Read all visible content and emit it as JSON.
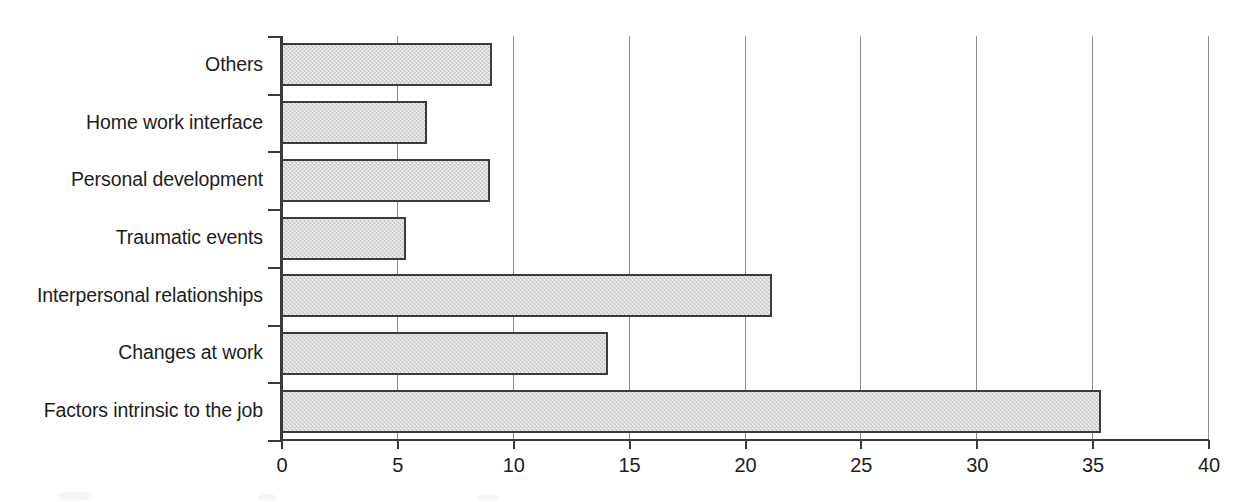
{
  "chart_data": {
    "type": "bar",
    "orientation": "horizontal",
    "title": "",
    "subtitle": "",
    "xlabel": "",
    "ylabel": "",
    "xlim": [
      0,
      40
    ],
    "xticks": [
      0,
      5,
      10,
      15,
      20,
      25,
      30,
      35,
      40
    ],
    "xtick_labels": [
      "0",
      "5",
      "10",
      "15",
      "20",
      "25",
      "30",
      "35",
      "40"
    ],
    "grid": "vertical gridlines at every x tick",
    "legend": "none",
    "categories": [
      "Others",
      "Home work interface",
      "Personal development",
      "Traumatic events",
      "Interpersonal relationships",
      "Changes at work",
      "Factors intrinsic to the job"
    ],
    "values": [
      9.1,
      6.3,
      9.0,
      5.4,
      21.2,
      14.1,
      35.4
    ],
    "bars": [
      {
        "category": "Others",
        "value": 9.1
      },
      {
        "category": "Home work interface",
        "value": 6.3
      },
      {
        "category": "Personal development",
        "value": 9.0
      },
      {
        "category": "Traumatic events",
        "value": 5.4
      },
      {
        "category": "Interpersonal relationships",
        "value": 21.2
      },
      {
        "category": "Changes at work",
        "value": 14.1
      },
      {
        "category": "Factors intrinsic to the job",
        "value": 35.4
      }
    ]
  },
  "style": {
    "bar_fill": "#d7d7d7",
    "bar_border": "#3b3b3b",
    "gridline_color": "#8d8d8d",
    "axis_color": "#3a3a3a",
    "text_color": "#1d1d1d",
    "background": "#ffffff"
  }
}
